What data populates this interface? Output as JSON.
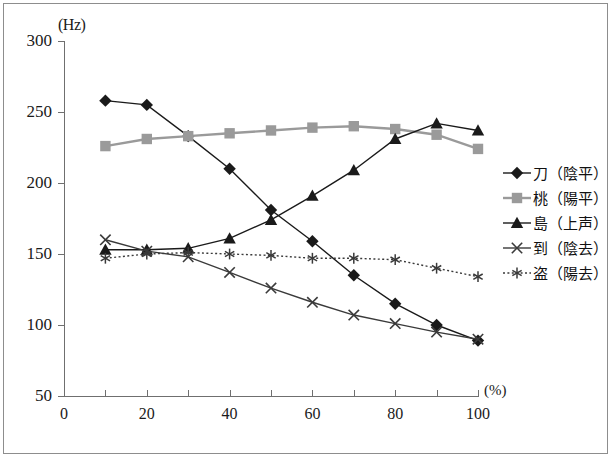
{
  "axes": {
    "y_unit": "(Hz)",
    "x_unit": "(%)",
    "y_ticks": [
      300,
      250,
      200,
      150,
      100,
      50
    ],
    "x_ticks": [
      0,
      20,
      40,
      60,
      80,
      100
    ],
    "x_minor_ticks": [
      0,
      10,
      20,
      30,
      40,
      50,
      60,
      70,
      80,
      90,
      100
    ]
  },
  "legend": {
    "items": [
      {
        "label": "刀（陰平）",
        "marker": "diamond",
        "color": "#1a1a1a"
      },
      {
        "label": "桃（陽平）",
        "marker": "square",
        "color": "#9a9a9a"
      },
      {
        "label": "島（上声）",
        "marker": "triangle",
        "color": "#1a1a1a"
      },
      {
        "label": "到（陰去）",
        "marker": "cross",
        "color": "#3a3a3a"
      },
      {
        "label": "盗（陽去）",
        "marker": "asterisk",
        "color": "#3a3a3a"
      }
    ]
  },
  "chart_data": {
    "type": "line",
    "title": "",
    "xlabel": "(%)",
    "ylabel": "(Hz)",
    "xlim": [
      0,
      100
    ],
    "ylim": [
      50,
      300
    ],
    "grid": false,
    "legend_position": "right",
    "x": [
      10,
      20,
      30,
      40,
      50,
      60,
      70,
      80,
      90,
      100
    ],
    "series": [
      {
        "name": "刀（陰平）",
        "marker": "diamond",
        "color": "#1a1a1a",
        "linestyle": "solid",
        "values": [
          258,
          255,
          233,
          210,
          181,
          159,
          135,
          115,
          100,
          89
        ]
      },
      {
        "name": "桃（陽平）",
        "marker": "square",
        "color": "#9a9a9a",
        "linestyle": "solid",
        "values": [
          226,
          231,
          233,
          235,
          237,
          239,
          240,
          238,
          234,
          224
        ]
      },
      {
        "name": "島（上声）",
        "marker": "triangle",
        "color": "#1a1a1a",
        "linestyle": "solid",
        "values": [
          153,
          153,
          154,
          161,
          174,
          191,
          209,
          231,
          242,
          237
        ]
      },
      {
        "name": "到（陰去）",
        "marker": "cross",
        "color": "#3a3a3a",
        "linestyle": "solid",
        "values": [
          160,
          152,
          148,
          137,
          126,
          116,
          107,
          101,
          95,
          90
        ]
      },
      {
        "name": "盗（陽去）",
        "marker": "asterisk",
        "color": "#3a3a3a",
        "linestyle": "dotted",
        "values": [
          147,
          150,
          151,
          150,
          149,
          147,
          147,
          146,
          140,
          134
        ]
      }
    ]
  }
}
